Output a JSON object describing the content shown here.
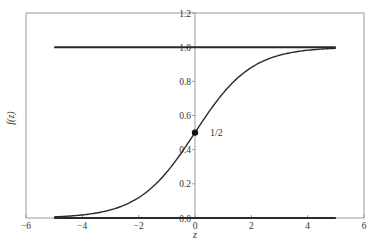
{
  "chart_data": {
    "type": "line",
    "title": "",
    "xlabel": "z",
    "ylabel": "f(z)",
    "xlim": [
      -6,
      6
    ],
    "ylim": [
      0,
      1.2
    ],
    "grid": false,
    "legend": null,
    "x_ticks": [
      -6,
      -4,
      -2,
      0,
      2,
      4,
      6
    ],
    "x_tick_labels": [
      "−6",
      "−4",
      "−2",
      "0",
      "2",
      "4",
      "6"
    ],
    "y_ticks": [
      0.0,
      0.2,
      0.4,
      0.6,
      0.8,
      1.0,
      1.2
    ],
    "y_tick_labels": [
      "0.0",
      "0.2",
      "0.4",
      "0.6",
      "0.8",
      "1.0",
      "1.2"
    ],
    "y_axis_position_x": 0,
    "series": [
      {
        "name": "sigmoid f(z) = 1/(1+e^-z)",
        "x": [
          -5,
          -4.5,
          -4,
          -3.5,
          -3,
          -2.5,
          -2,
          -1.5,
          -1,
          -0.5,
          0,
          0.5,
          1,
          1.5,
          2,
          2.5,
          3,
          3.5,
          4,
          4.5,
          5
        ],
        "values": [
          0.0067,
          0.011,
          0.018,
          0.0293,
          0.0474,
          0.0759,
          0.1192,
          0.1824,
          0.2689,
          0.3775,
          0.5,
          0.6225,
          0.7311,
          0.8176,
          0.8808,
          0.9241,
          0.9526,
          0.9707,
          0.982,
          0.989,
          0.9933
        ]
      },
      {
        "name": "upper asymptote y=1",
        "x": [
          -5,
          5
        ],
        "values": [
          1.0,
          1.0
        ]
      },
      {
        "name": "lower asymptote y=0",
        "x": [
          -5,
          5
        ],
        "values": [
          0.0,
          0.0
        ]
      }
    ],
    "annotations": [
      {
        "type": "point",
        "x": 0,
        "y": 0.5,
        "label": "1/2"
      }
    ]
  },
  "colors": {
    "curve": "#2a2a2a",
    "frame": "#9a9a9a",
    "text": "#333333",
    "background": "#ffffff"
  }
}
